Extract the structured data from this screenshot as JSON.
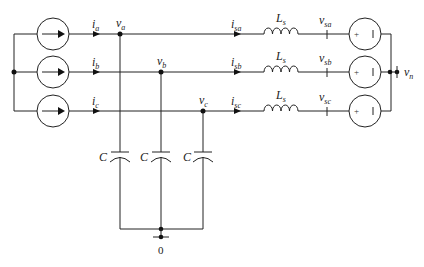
{
  "diagram": {
    "phases": [
      {
        "current_label": "i",
        "current_sub": "a",
        "node_label": "v",
        "node_sub": "a",
        "line_current": "i",
        "line_current_sub": "sa",
        "inductor": "L",
        "inductor_sub": "s",
        "grid_voltage": "v",
        "grid_voltage_sub": "sa"
      },
      {
        "current_label": "i",
        "current_sub": "b",
        "node_label": "v",
        "node_sub": "b",
        "line_current": "i",
        "line_current_sub": "sb",
        "inductor": "L",
        "inductor_sub": "s",
        "grid_voltage": "v",
        "grid_voltage_sub": "sb"
      },
      {
        "current_label": "i",
        "current_sub": "c",
        "node_label": "v",
        "node_sub": "c",
        "line_current": "i",
        "line_current_sub": "sc",
        "inductor": "L",
        "inductor_sub": "s",
        "grid_voltage": "v",
        "grid_voltage_sub": "sc"
      }
    ],
    "capacitors": [
      "C",
      "C",
      "C"
    ],
    "neutral": {
      "label": "v",
      "sub": "n"
    },
    "ground": {
      "label": "0"
    },
    "source_plus": "+",
    "source_minus": "|"
  }
}
